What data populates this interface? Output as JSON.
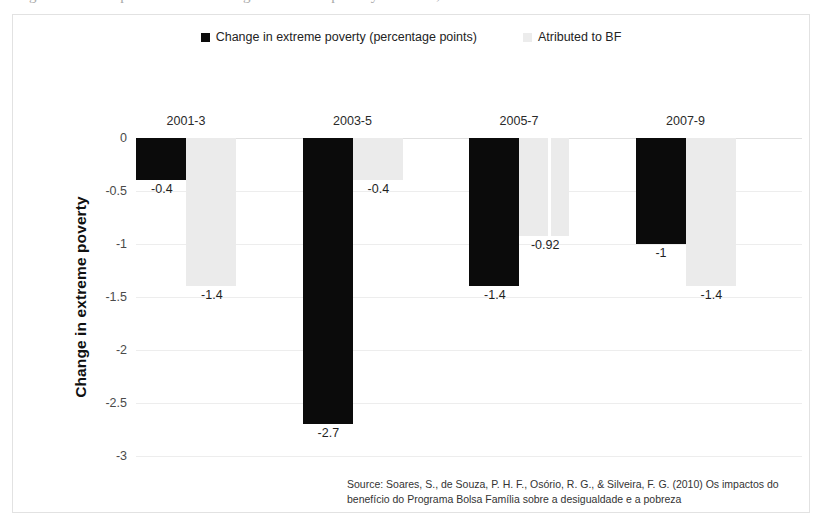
{
  "top_caption_partial": "Figure 3. Decomposition of the change in extreme poverty in Brazil, 2001-2009",
  "legend": {
    "position": "top-center",
    "entries": [
      {
        "label": "Change in extreme poverty (percentage points)",
        "swatch": "series-dark",
        "color": "#0b0b0b"
      },
      {
        "label": "Atributed to BF",
        "swatch": "series-light",
        "color": "#ececec"
      }
    ]
  },
  "y_axis": {
    "title": "Change in extreme poverty",
    "ticks": [
      "0",
      "-0.5",
      "-1",
      "-1.5",
      "-2",
      "-2.5",
      "-3"
    ]
  },
  "source": {
    "line1": "Source: Soares, S., de Souza, P. H. F., Osório, R. G., & Silveira, F. G. (2010) Os impactos do",
    "line2": "benefício do Programa Bolsa Família sobre a desigualdade e a pobreza"
  },
  "chart_data": {
    "type": "bar",
    "title": "",
    "xlabel": "",
    "ylabel": "Change in extreme poverty",
    "ylim": [
      -3,
      0
    ],
    "yticks": [
      0,
      -0.5,
      -1,
      -1.5,
      -2,
      -2.5,
      -3
    ],
    "grid": true,
    "legend_position": "top-center",
    "categories": [
      "2001-3",
      "2003-5",
      "2005-7",
      "2007-9"
    ],
    "series": [
      {
        "name": "Change in extreme poverty (percentage points)",
        "color": "#0b0b0b",
        "values": [
          -0.4,
          -2.7,
          -1.4,
          -1
        ],
        "labels": [
          "-0.4",
          "-2.7",
          "-1.4",
          "-1"
        ]
      },
      {
        "name": "Atributed to BF",
        "color": "#ececec",
        "values": [
          -1.4,
          -0.4,
          -0.92,
          -1.4
        ],
        "labels": [
          "-1.4",
          "-0.4",
          "-0.92",
          "-1.4"
        ]
      }
    ]
  }
}
